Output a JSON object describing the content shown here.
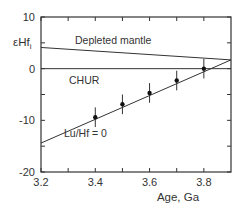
{
  "chart_data": {
    "type": "line",
    "title": "",
    "xlabel": "Age, Ga",
    "ylabel": "εHf_i",
    "ylabel_main": "εHf",
    "ylabel_sub": "i",
    "xlim": [
      3.2,
      3.9
    ],
    "ylim": [
      -20,
      10
    ],
    "x_ticks": [
      3.2,
      3.4,
      3.6,
      3.8
    ],
    "x_tick_labels": [
      "3.2",
      "3.4",
      "3.6",
      "3.8"
    ],
    "x_minor_ticks": [
      3.3,
      3.5,
      3.7
    ],
    "y_ticks": [
      10,
      0,
      -10,
      -20
    ],
    "y_tick_labels": [
      "10",
      "0",
      "-10",
      "-20"
    ],
    "y_minor_ticks": [
      5,
      -5,
      -15
    ],
    "grid": false,
    "series": [
      {
        "name": "Depleted mantle",
        "style": "line",
        "x": [
          3.2,
          3.9
        ],
        "y": [
          4.1,
          1.7
        ]
      },
      {
        "name": "CHUR",
        "style": "line",
        "x": [
          3.2,
          3.9
        ],
        "y": [
          0,
          0
        ]
      },
      {
        "name": "Lu/Hf = 0",
        "style": "line",
        "x": [
          3.2,
          3.9
        ],
        "y": [
          -14.4,
          1.7
        ]
      },
      {
        "name": "Data",
        "style": "points_with_errorbars",
        "x": [
          3.4,
          3.5,
          3.6,
          3.7,
          3.8
        ],
        "y": [
          -9.4,
          -6.9,
          -4.7,
          -2.3,
          0.0
        ],
        "yerr": [
          1.9,
          1.9,
          1.9,
          1.9,
          1.9
        ]
      }
    ],
    "annotations": [
      {
        "text": "Depleted mantle",
        "x": 3.3,
        "y": 5.5
      },
      {
        "text": "CHUR",
        "x": 3.31,
        "y": -3
      },
      {
        "text": "Lu/Hf = 0",
        "x": 3.43,
        "y": -13
      }
    ]
  }
}
